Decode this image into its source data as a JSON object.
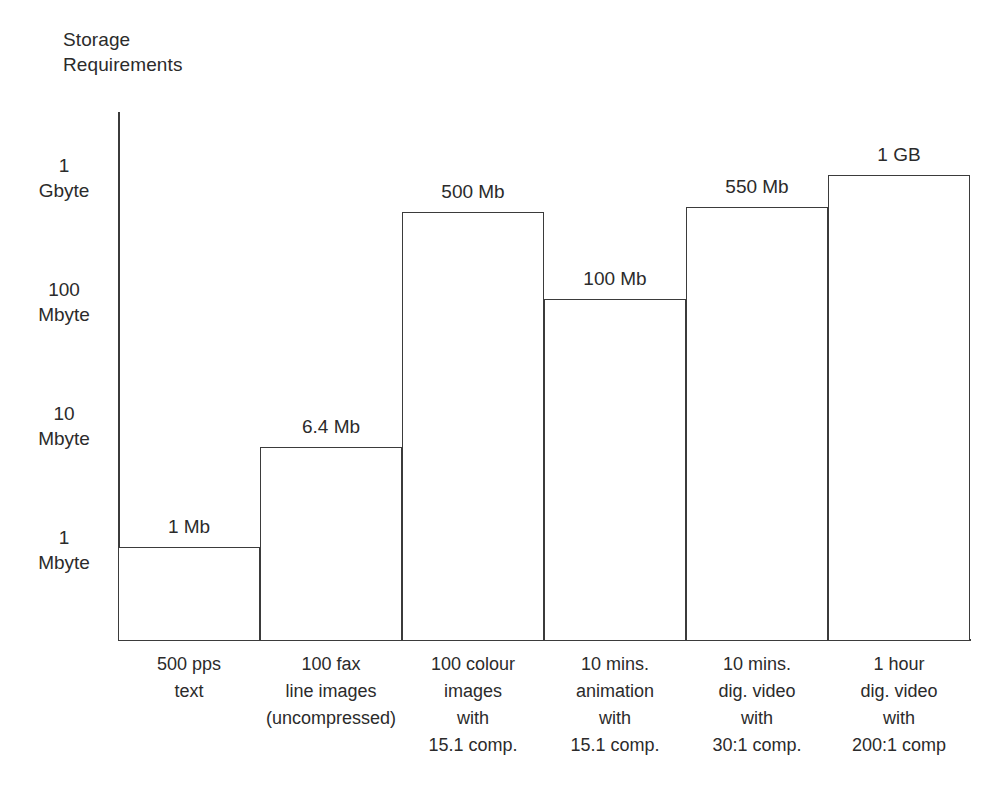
{
  "chart_data": {
    "type": "bar",
    "title": "Storage\nRequirements",
    "xlabel": "",
    "ylabel": "Storage Requirements",
    "scale": "log",
    "grid": false,
    "legend": false,
    "ylim": [
      1,
      1000
    ],
    "y_unit": "Mbyte",
    "y_ticks": [
      {
        "value": 1000,
        "label": "1\nGbyte"
      },
      {
        "value": 100,
        "label": "100\nMbyte"
      },
      {
        "value": 10,
        "label": "10\nMbyte"
      },
      {
        "value": 1,
        "label": "1\nMbyte"
      }
    ],
    "categories": [
      "500 pps\ntext",
      "100 fax\nline images\n(uncompressed)",
      "100 colour\nimages\nwith\n15.1 comp.",
      "10 mins.\nanimation\nwith\n15.1 comp.",
      "10 mins.\ndig. video\nwith\n30:1 comp.",
      "1 hour\ndig. video\nwith\n200:1 comp"
    ],
    "values": [
      1,
      6.4,
      500,
      100,
      550,
      1000
    ],
    "value_labels": [
      "1 Mb",
      "6.4 Mb",
      "500 Mb",
      "100 Mb",
      "550 Mb",
      "1 GB"
    ],
    "colors": {
      "background": "#ffffff",
      "bar_fill": "#ffffff",
      "bar_stroke": "#3b3b3b",
      "axis": "#3b3b3b",
      "text": "#2b2b2b"
    }
  }
}
